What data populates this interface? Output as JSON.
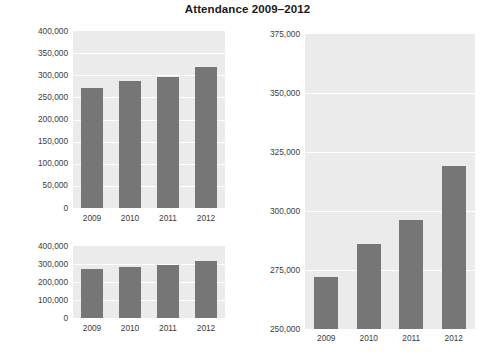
{
  "title": "Attendance 2009–2012",
  "colors": {
    "bar": "#767676",
    "plot_background": "#ebebeb",
    "gridline": "#ffffff",
    "text": "#3c3c3c",
    "page_background": "#ffffff"
  },
  "chart_data": [
    {
      "id": "top-left",
      "type": "bar",
      "title": "Attendance 2009–2012",
      "categories": [
        "2009",
        "2010",
        "2011",
        "2012"
      ],
      "values": [
        272000,
        286000,
        296000,
        319000
      ],
      "xlabel": "",
      "ylabel": "",
      "ylim": [
        0,
        400000
      ],
      "ytick_values": [
        0,
        50000,
        100000,
        150000,
        200000,
        250000,
        300000,
        350000,
        400000
      ],
      "ytick_labels": [
        "0",
        "50,000",
        "100,000",
        "150,000",
        "200,000",
        "250,000",
        "300,000",
        "350,000",
        "400,000"
      ],
      "grid": true,
      "legend": false
    },
    {
      "id": "bottom-left",
      "type": "bar",
      "title": "",
      "categories": [
        "2009",
        "2010",
        "2011",
        "2012"
      ],
      "values": [
        272000,
        286000,
        296000,
        319000
      ],
      "xlabel": "",
      "ylabel": "",
      "ylim": [
        0,
        400000
      ],
      "ytick_values": [
        0,
        100000,
        200000,
        300000,
        400000
      ],
      "ytick_labels": [
        "0",
        "100,000",
        "200,000",
        "300,000",
        "400,000"
      ],
      "grid": true,
      "legend": false
    },
    {
      "id": "right",
      "type": "bar",
      "title": "",
      "categories": [
        "2009",
        "2010",
        "2011",
        "2012"
      ],
      "values": [
        272000,
        286000,
        296000,
        319000
      ],
      "xlabel": "",
      "ylabel": "",
      "ylim": [
        250000,
        375000
      ],
      "ytick_values": [
        250000,
        275000,
        300000,
        325000,
        350000,
        375000
      ],
      "ytick_labels": [
        "250,000",
        "275,000",
        "300,000",
        "325,000",
        "350,000",
        "375,000"
      ],
      "grid": true,
      "legend": false
    }
  ]
}
